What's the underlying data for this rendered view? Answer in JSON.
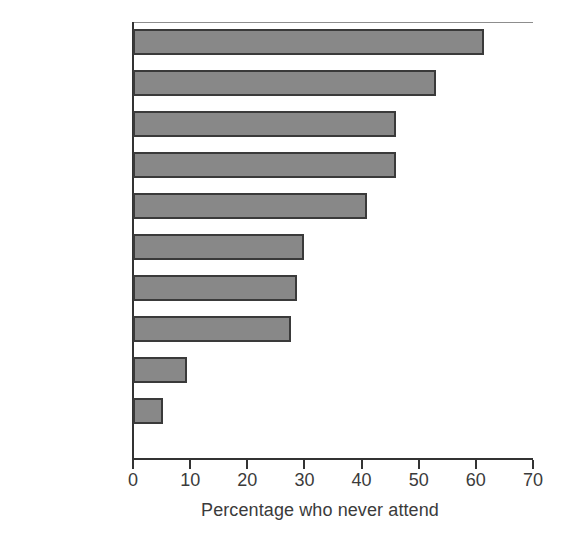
{
  "chart_data": {
    "type": "bar",
    "orientation": "horizontal",
    "title": "",
    "xlabel": "Percentage who never attend",
    "ylabel": "",
    "xlim": [
      0,
      70
    ],
    "xticks": [
      0,
      10,
      20,
      30,
      40,
      50,
      60,
      70
    ],
    "grid": false,
    "legend": null,
    "bar_color": "#888888",
    "bar_border_color": "#3a3a3a",
    "text_color": "#3b3b3b",
    "background": "#ffffff",
    "categories": [
      "Czech Rep.",
      "France",
      "UK",
      "Netherlands",
      "Spain",
      "Sweden",
      "EU-27",
      "Germany",
      "Italy",
      "Poland"
    ],
    "values": [
      61.5,
      53.0,
      46.0,
      46.0,
      41.0,
      30.0,
      28.7,
      27.7,
      9.5,
      5.2
    ]
  }
}
